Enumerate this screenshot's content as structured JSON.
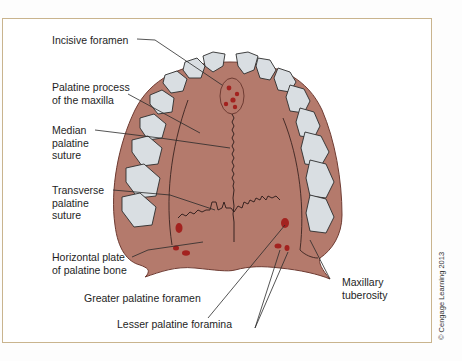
{
  "figure": {
    "colors": {
      "palate": "#b47a6c",
      "palate_outline": "#6e3b32",
      "teeth": "#d9dee2",
      "foramen": "#a3221f",
      "frame": "#c9b48e",
      "text": "#1e1e1e"
    }
  },
  "labels": {
    "incisive_foramen": "Incisive foramen",
    "palatine_process": "Palatine process\nof the maxilla",
    "median_palatine_suture": "Median\npalatine\nsuture",
    "transverse_palatine_suture": "Transverse\npalatine\nsuture",
    "horizontal_plate": "Horizontal plate\nof palatine bone",
    "greater_palatine_foramen": "Greater palatine foramen",
    "lesser_palatine_foramina": "Lesser palatine foramina",
    "maxillary_tuberosity": "Maxillary\ntuberosity"
  },
  "copyright": "© Cengage Learning 2013"
}
